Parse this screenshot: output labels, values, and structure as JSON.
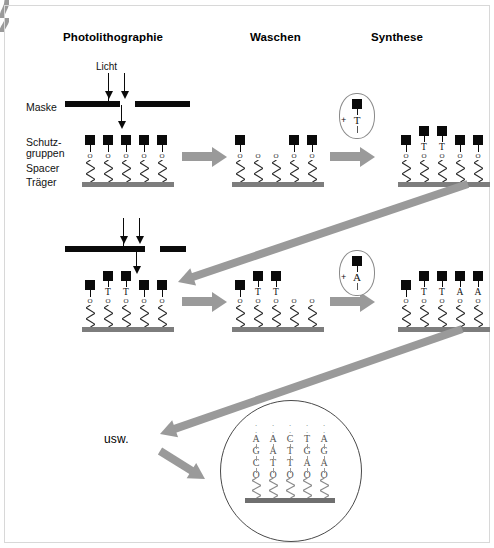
{
  "diagram": {
    "title_columns": [
      {
        "id": "photolithographie",
        "label": "Photolithographie"
      },
      {
        "id": "waschen",
        "label": "Waschen"
      },
      {
        "id": "synthese",
        "label": "Synthese"
      }
    ],
    "side_labels": [
      {
        "id": "maske",
        "label": "Maske"
      },
      {
        "id": "schutzgruppen_l1",
        "label": "Schutz-"
      },
      {
        "id": "schutzgruppen_l2",
        "label": "gruppen"
      },
      {
        "id": "spacer",
        "label": "Spacer"
      },
      {
        "id": "traeger",
        "label": "Träger"
      }
    ],
    "light_label": "Licht",
    "etc_label": "usw.",
    "linker_symbol": "O",
    "plus_symbol": "+",
    "colors": {
      "protecting_group": "#0a0a0a",
      "mask": "#0a0a0a",
      "substrate": "#7d7d7d",
      "arrow": "#9a9a9a",
      "circle_outline": "#4a4a4a",
      "background": "#ffffff"
    }
  },
  "rows": [
    {
      "id": "row-1",
      "photolithography": {
        "mask_gap_positions": [
          2,
          3
        ],
        "sites": [
          {
            "pos": 1,
            "protected": true,
            "base": ""
          },
          {
            "pos": 2,
            "protected": true,
            "base": ""
          },
          {
            "pos": 3,
            "protected": true,
            "base": ""
          },
          {
            "pos": 4,
            "protected": true,
            "base": ""
          },
          {
            "pos": 5,
            "protected": true,
            "base": ""
          }
        ]
      },
      "wash": {
        "sites": [
          {
            "pos": 1,
            "protected": true,
            "base": ""
          },
          {
            "pos": 2,
            "protected": false,
            "base": ""
          },
          {
            "pos": 3,
            "protected": false,
            "base": ""
          },
          {
            "pos": 4,
            "protected": true,
            "base": ""
          },
          {
            "pos": 5,
            "protected": true,
            "base": ""
          }
        ]
      },
      "synthesis": {
        "reagent": "T",
        "reagent_label": "+ T",
        "sites": [
          {
            "pos": 1,
            "protected": true,
            "base": ""
          },
          {
            "pos": 2,
            "protected": true,
            "base": "T"
          },
          {
            "pos": 3,
            "protected": true,
            "base": "T"
          },
          {
            "pos": 4,
            "protected": true,
            "base": ""
          },
          {
            "pos": 5,
            "protected": true,
            "base": ""
          }
        ]
      }
    },
    {
      "id": "row-2",
      "photolithography": {
        "mask_gap_positions": [
          4,
          5
        ],
        "sites": [
          {
            "pos": 1,
            "protected": true,
            "base": ""
          },
          {
            "pos": 2,
            "protected": true,
            "base": "T"
          },
          {
            "pos": 3,
            "protected": true,
            "base": "T"
          },
          {
            "pos": 4,
            "protected": true,
            "base": ""
          },
          {
            "pos": 5,
            "protected": true,
            "base": ""
          }
        ]
      },
      "wash": {
        "sites": [
          {
            "pos": 1,
            "protected": true,
            "base": ""
          },
          {
            "pos": 2,
            "protected": true,
            "base": "T"
          },
          {
            "pos": 3,
            "protected": true,
            "base": "T"
          },
          {
            "pos": 4,
            "protected": false,
            "base": ""
          },
          {
            "pos": 5,
            "protected": false,
            "base": ""
          }
        ]
      },
      "synthesis": {
        "reagent": "A",
        "reagent_label": "+ A",
        "sites": [
          {
            "pos": 1,
            "protected": true,
            "base": ""
          },
          {
            "pos": 2,
            "protected": true,
            "base": "T"
          },
          {
            "pos": 3,
            "protected": true,
            "base": "T"
          },
          {
            "pos": 4,
            "protected": true,
            "base": "A"
          },
          {
            "pos": 5,
            "protected": true,
            "base": "A"
          }
        ]
      }
    }
  ],
  "final_array": {
    "id": "finished-microarray",
    "note": "Sequences read from substrate upward",
    "continuation_marker": "⋮",
    "strands": [
      {
        "pos": 1,
        "sequence": [
          "C",
          "G",
          "A"
        ]
      },
      {
        "pos": 2,
        "sequence": [
          "T",
          "A",
          "A"
        ]
      },
      {
        "pos": 3,
        "sequence": [
          "T",
          "T",
          "C"
        ]
      },
      {
        "pos": 4,
        "sequence": [
          "A",
          "G",
          "T"
        ]
      },
      {
        "pos": 5,
        "sequence": [
          "A",
          "G",
          "A"
        ]
      }
    ]
  }
}
